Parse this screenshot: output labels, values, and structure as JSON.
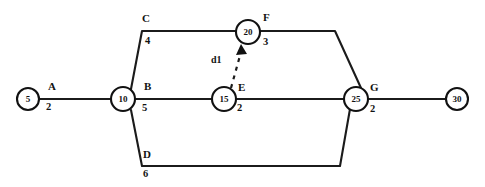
{
  "diagram": {
    "type": "network-diagram",
    "background_color": "#ffffff",
    "line_color": "#1b1b1b",
    "text_color": "#121212",
    "nodes": [
      {
        "id": "n5",
        "label": "5",
        "cx": 28,
        "cy": 99,
        "r": 11
      },
      {
        "id": "n10",
        "label": "10",
        "cx": 123,
        "cy": 99,
        "r": 12
      },
      {
        "id": "n15",
        "label": "15",
        "cx": 224,
        "cy": 99,
        "r": 12
      },
      {
        "id": "n20",
        "label": "20",
        "cx": 248,
        "cy": 32,
        "r": 12
      },
      {
        "id": "n25",
        "label": "25",
        "cx": 356,
        "cy": 99,
        "r": 12
      },
      {
        "id": "n30",
        "label": "30",
        "cx": 457,
        "cy": 99,
        "r": 11
      }
    ],
    "activities": [
      {
        "id": "A",
        "label": "A",
        "duration": "2",
        "from": "5",
        "to": "10",
        "path": "M 39,99 L 111,99",
        "label_x": 48,
        "label_y": 90,
        "duration_x": 46,
        "duration_y": 110,
        "dummy": false
      },
      {
        "id": "C",
        "label": "C",
        "duration": "4",
        "from": "10",
        "to": "20",
        "path": "M 131,89 L 142,31 L 236,31",
        "label_x": 142,
        "label_y": 22,
        "duration_x": 145,
        "duration_y": 44,
        "dummy": false
      },
      {
        "id": "B",
        "label": "B",
        "duration": "5",
        "from": "10",
        "to": "15",
        "path": "M 135,99 L 212,99",
        "label_x": 144,
        "label_y": 90,
        "duration_x": 142,
        "duration_y": 111,
        "dummy": false
      },
      {
        "id": "D",
        "label": "D",
        "duration": "6",
        "from": "10",
        "to": "25",
        "path": "M 131,110 L 142,166 L 340,166 L 350,109",
        "label_x": 143,
        "label_y": 158,
        "duration_x": 143,
        "duration_y": 177,
        "dummy": false
      },
      {
        "id": "E",
        "label": "E",
        "duration": "2",
        "from": "15",
        "to": "25",
        "path": "M 236,99 L 344,99",
        "label_x": 238,
        "label_y": 91,
        "duration_x": 237,
        "duration_y": 111,
        "dummy": false
      },
      {
        "id": "F",
        "label": "F",
        "duration": "3",
        "from": "20",
        "to": "25",
        "path": "M 260,31 L 335,31 L 361,88",
        "label_x": 263,
        "label_y": 21,
        "duration_x": 263,
        "duration_y": 45,
        "dummy": false
      },
      {
        "id": "G",
        "label": "G",
        "duration": "2",
        "from": "25",
        "to": "30",
        "path": "M 368,99 L 446,99",
        "label_x": 370,
        "label_y": 91,
        "duration_x": 370,
        "duration_y": 112,
        "dummy": false
      },
      {
        "id": "d1",
        "label": "d1",
        "duration": "",
        "from": "15",
        "to": "20",
        "path": "M 231,88 L 241,52",
        "label_x": 211,
        "label_y": 63,
        "duration_x": 0,
        "duration_y": 0,
        "dummy": true,
        "arrow_points": "241,44 236,55 247,54"
      }
    ]
  }
}
